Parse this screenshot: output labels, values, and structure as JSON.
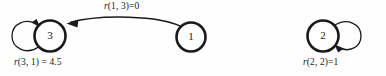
{
  "diagram": {
    "type": "state-transition-graph",
    "background_color": "#fefefe",
    "ink_color": "#1a1a1a",
    "nodes": [
      {
        "id": "3",
        "label": "3",
        "cx": 50,
        "cy": 36,
        "r": 15.5
      },
      {
        "id": "1",
        "label": "1",
        "cx": 191,
        "cy": 37,
        "r": 14.5
      },
      {
        "id": "2",
        "label": "2",
        "cx": 323,
        "cy": 36,
        "r": 15.5
      }
    ],
    "edges": [
      {
        "name": "edge-1-to-3",
        "from": "1",
        "to": "3",
        "kind": "curved-arc",
        "label": "r(1, 3)=0",
        "label_fn": "r",
        "label_rest": "(1, 3)=0"
      },
      {
        "name": "self-loop-3",
        "from": "3",
        "to": "3",
        "kind": "self-loop-left",
        "label": "r(3, 1) = 4.5",
        "label_fn": "r",
        "label_rest": "(3, 1) = 4.5"
      },
      {
        "name": "self-loop-2",
        "from": "2",
        "to": "2",
        "kind": "self-loop-right",
        "label": "r(2, 2)=1",
        "label_fn": "r",
        "label_rest": "(2, 2)=1"
      }
    ]
  }
}
